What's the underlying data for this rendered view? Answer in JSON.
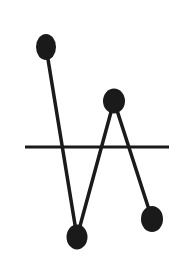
{
  "diagram": {
    "background": "#ffffff",
    "stroke_color": "#1a1a1a",
    "fill_color": "#1a1a1a",
    "baseline": {
      "x1": 25,
      "y1": 147,
      "x2": 169,
      "y2": 147,
      "width": 3
    },
    "points": [
      {
        "id": "p1",
        "cx": 46,
        "cy": 47,
        "rx": 10,
        "ry": 13
      },
      {
        "id": "p2",
        "cx": 77,
        "cy": 237,
        "rx": 10.5,
        "ry": 12.5
      },
      {
        "id": "p3",
        "cx": 114,
        "cy": 101,
        "rx": 11,
        "ry": 12.5
      },
      {
        "id": "p4",
        "cx": 152,
        "cy": 219,
        "rx": 11,
        "ry": 13
      }
    ],
    "segments": [
      {
        "from": 0,
        "to": 1,
        "width": 3.5
      },
      {
        "from": 1,
        "to": 2,
        "width": 3.5
      },
      {
        "from": 2,
        "to": 3,
        "width": 3.5
      }
    ]
  }
}
